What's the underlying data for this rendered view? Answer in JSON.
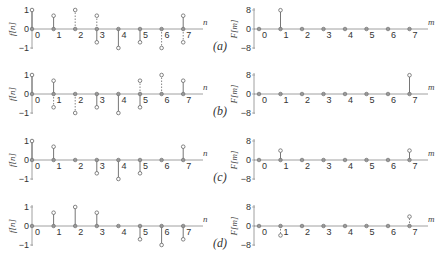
{
  "figure": {
    "rows": [
      {
        "label": "(a)",
        "f_values": {
          "re": [
            1,
            0.7,
            0,
            -0.7,
            -1,
            -0.7,
            0,
            0.7
          ],
          "im": [
            0,
            0,
            1,
            0.7,
            0,
            0,
            -1,
            -0.7
          ]
        },
        "F_values": {
          "re": [
            0,
            8,
            0,
            0,
            0,
            0,
            0,
            0
          ],
          "im": [
            0,
            0,
            0,
            0,
            0,
            0,
            0,
            0
          ]
        }
      },
      {
        "label": "(b)",
        "f_values": {
          "re": [
            1,
            0.7,
            0,
            -0.7,
            -1,
            -0.7,
            0,
            0.7
          ],
          "im": [
            0,
            -0.7,
            -1,
            0,
            0,
            0.7,
            1,
            0
          ]
        },
        "F_values": {
          "re": [
            0,
            0,
            0,
            0,
            0,
            0,
            0,
            8
          ],
          "im": [
            0,
            0,
            0,
            0,
            0,
            0,
            0,
            0
          ]
        }
      },
      {
        "label": "(c)",
        "f_values": {
          "re": [
            1,
            0.7,
            0,
            -0.7,
            -1,
            -0.7,
            0,
            0.7
          ],
          "im": [
            0,
            0,
            0,
            0,
            0,
            0,
            0,
            0
          ]
        },
        "F_values": {
          "re": [
            0,
            4,
            0,
            0,
            0,
            0,
            0,
            4
          ],
          "im": [
            0,
            0,
            0,
            0,
            0,
            0,
            0,
            0
          ]
        }
      },
      {
        "label": "(d)",
        "f_values": {
          "re": [
            0,
            0.7,
            1,
            0.7,
            0,
            -0.7,
            -1,
            -0.7
          ],
          "im": [
            0,
            0,
            0,
            0,
            0,
            0,
            0,
            0
          ]
        },
        "F_values": {
          "re": [
            0,
            0,
            0,
            0,
            0,
            0,
            0,
            0
          ],
          "im": [
            0,
            -4,
            0,
            0,
            0,
            0,
            0,
            4
          ]
        }
      }
    ],
    "left_axis": {
      "ylabel": "f[n]",
      "xlabel": "n",
      "yticks": [
        "1",
        "0",
        "−1"
      ],
      "xticks": [
        "0",
        "1",
        "2",
        "3",
        "4",
        "5",
        "6",
        "7"
      ]
    },
    "right_axis": {
      "ylabel": "F[m]",
      "xlabel": "m",
      "yticks": [
        "8",
        "0",
        "−8"
      ],
      "xticks": [
        "0",
        "1",
        "2",
        "3",
        "4",
        "5",
        "6",
        "7"
      ]
    }
  },
  "chart_data": [
    {
      "type": "stem",
      "title": "(a) f[n]",
      "xlabel": "n",
      "ylabel": "f[n]",
      "x": [
        0,
        1,
        2,
        3,
        4,
        5,
        6,
        7
      ],
      "series": [
        {
          "name": "real (solid)",
          "values": [
            1,
            0.7,
            0,
            -0.7,
            -1,
            -0.7,
            0,
            0.7
          ]
        },
        {
          "name": "imag (dashed)",
          "values": [
            0,
            0,
            1,
            0.7,
            0,
            0,
            -1,
            -0.7
          ]
        }
      ],
      "ylim": [
        -1,
        1
      ]
    },
    {
      "type": "stem",
      "title": "(a) F[m]",
      "xlabel": "m",
      "ylabel": "F[m]",
      "x": [
        0,
        1,
        2,
        3,
        4,
        5,
        6,
        7
      ],
      "series": [
        {
          "name": "real",
          "values": [
            0,
            8,
            0,
            0,
            0,
            0,
            0,
            0
          ]
        }
      ],
      "ylim": [
        -8,
        8
      ]
    },
    {
      "type": "stem",
      "title": "(b) f[n]",
      "xlabel": "n",
      "ylabel": "f[n]",
      "x": [
        0,
        1,
        2,
        3,
        4,
        5,
        6,
        7
      ],
      "series": [
        {
          "name": "real (solid)",
          "values": [
            1,
            0.7,
            0,
            -0.7,
            -1,
            -0.7,
            0,
            0.7
          ]
        },
        {
          "name": "imag (dashed)",
          "values": [
            0,
            -0.7,
            -1,
            0,
            0,
            0.7,
            1,
            0
          ]
        }
      ],
      "ylim": [
        -1,
        1
      ]
    },
    {
      "type": "stem",
      "title": "(b) F[m]",
      "xlabel": "m",
      "ylabel": "F[m]",
      "x": [
        0,
        1,
        2,
        3,
        4,
        5,
        6,
        7
      ],
      "series": [
        {
          "name": "real",
          "values": [
            0,
            0,
            0,
            0,
            0,
            0,
            0,
            8
          ]
        }
      ],
      "ylim": [
        -8,
        8
      ]
    },
    {
      "type": "stem",
      "title": "(c) f[n]",
      "xlabel": "n",
      "ylabel": "f[n]",
      "x": [
        0,
        1,
        2,
        3,
        4,
        5,
        6,
        7
      ],
      "series": [
        {
          "name": "real",
          "values": [
            1,
            0.7,
            0,
            -0.7,
            -1,
            -0.7,
            0,
            0.7
          ]
        }
      ],
      "ylim": [
        -1,
        1
      ]
    },
    {
      "type": "stem",
      "title": "(c) F[m]",
      "xlabel": "m",
      "ylabel": "F[m]",
      "x": [
        0,
        1,
        2,
        3,
        4,
        5,
        6,
        7
      ],
      "series": [
        {
          "name": "real",
          "values": [
            0,
            4,
            0,
            0,
            0,
            0,
            0,
            4
          ]
        }
      ],
      "ylim": [
        -8,
        8
      ]
    },
    {
      "type": "stem",
      "title": "(d) f[n]",
      "xlabel": "n",
      "ylabel": "f[n]",
      "x": [
        0,
        1,
        2,
        3,
        4,
        5,
        6,
        7
      ],
      "series": [
        {
          "name": "real",
          "values": [
            0,
            0.7,
            1,
            0.7,
            0,
            -0.7,
            -1,
            -0.7
          ]
        }
      ],
      "ylim": [
        -1,
        1
      ]
    },
    {
      "type": "stem",
      "title": "(d) F[m]",
      "xlabel": "m",
      "ylabel": "F[m]",
      "x": [
        0,
        1,
        2,
        3,
        4,
        5,
        6,
        7
      ],
      "series": [
        {
          "name": "imag (dashed)",
          "values": [
            0,
            -4,
            0,
            0,
            0,
            0,
            0,
            4
          ]
        }
      ],
      "ylim": [
        -8,
        8
      ]
    }
  ]
}
